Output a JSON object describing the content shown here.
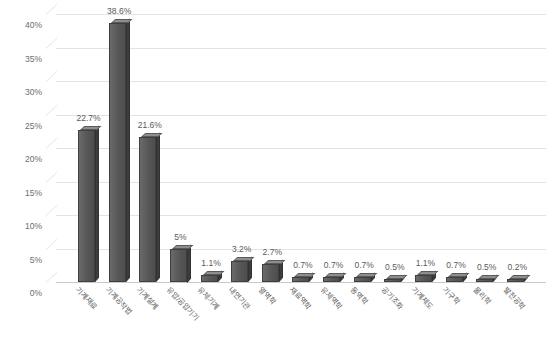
{
  "chart_data": {
    "type": "bar",
    "title": "",
    "subtitle": "",
    "xlabel": "",
    "ylabel": "",
    "ylim": [
      0,
      40
    ],
    "ytick_step": 5,
    "grid": true,
    "legend": false,
    "legend_position": "none",
    "value_label_suffix": "%",
    "bar_color": "#5c5c5c",
    "bar_top_color": "#8e8e8e",
    "bar_side_color": "#3c3c3c",
    "gridline_color": "#e3e3e3",
    "axis_color": "#c9c9c9",
    "text_color": "#5e5e5e",
    "background_color": "#ffffff",
    "ytick_labels": [
      "0%",
      "5%",
      "10%",
      "15%",
      "20%",
      "25%",
      "30%",
      "35%",
      "40%"
    ],
    "ytick_values": [
      0,
      5,
      10,
      15,
      20,
      25,
      30,
      35,
      40
    ],
    "categories": [
      "기계재료",
      "기계공작법",
      "기계설계",
      "유압/공압기기",
      "유체기계",
      "내연기관",
      "열역학",
      "재료역학",
      "유체역학",
      "동역학",
      "공기조화",
      "기계제도",
      "기구학",
      "물리학",
      "발전공학"
    ],
    "values": [
      22.7,
      38.6,
      21.6,
      5.0,
      1.1,
      3.2,
      2.7,
      0.7,
      0.7,
      0.7,
      0.5,
      1.1,
      0.7,
      0.5,
      0.2
    ],
    "data_labels": [
      "22.7%",
      "38.6%",
      "21.6%",
      "5%",
      "1.1%",
      "3.2%",
      "2.7%",
      "0.7%",
      "0.7%",
      "0.7%",
      "0.5%",
      "1.1%",
      "0.7%",
      "0.5%",
      "0.2%"
    ]
  }
}
